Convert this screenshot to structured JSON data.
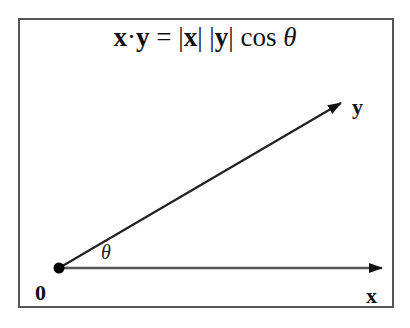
{
  "diagram": {
    "formula": {
      "x_bold": "x",
      "dot": "·",
      "y_bold": "y",
      "equals": " = ",
      "abs_x_open": "|",
      "abs_x": "x",
      "abs_x_close": "|",
      "space": " ",
      "abs_y_open": "|",
      "abs_y": "y",
      "abs_y_close": "|",
      "cos": " cos ",
      "theta": "θ"
    },
    "labels": {
      "origin": "0",
      "vector_x": "x",
      "vector_y": "y",
      "angle": "θ"
    },
    "colors": {
      "stroke": "#222222",
      "x_axis_stroke": "#555555",
      "border": "#555555"
    }
  }
}
